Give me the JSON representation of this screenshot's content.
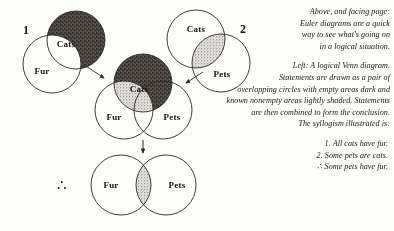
{
  "figure": {
    "colors": {
      "ink": "#2b2723",
      "dark_fill": "#4a4540",
      "stipple_fill": "#c9c6c0",
      "paper": "#fdfdfc"
    },
    "steps": [
      {
        "number": "1",
        "labels": [
          "Cats",
          "Fur"
        ]
      },
      {
        "number": "2",
        "labels": [
          "Cats",
          "Pets"
        ]
      }
    ],
    "combined": {
      "labels": [
        "Cats",
        "Fur",
        "Pets"
      ]
    },
    "conclusion": {
      "labels": [
        "Fur",
        "Pets"
      ],
      "therefore_symbol": "∴"
    },
    "step1_number": "1",
    "step2_number": "2",
    "label_cats": "Cats",
    "label_fur": "Fur",
    "label_pets": "Pets",
    "therefore_symbol": "∴"
  },
  "caption": {
    "block1": [
      "Above, and facing page:",
      "Euler diagrams are a quick",
      "way to see what's going on",
      "in a logical situation."
    ],
    "block2": [
      "Left:  A logical Venn diagram.",
      "Statements are drawn as a pair of",
      "overlapping circles with empty areas dark and",
      "known nonempty areas lightly shaded.  Statements",
      "are then combined to form the conclusion.",
      "The syllogism illustrated is:"
    ],
    "syllogism": [
      "1. All cats have fur.",
      "2. Some pets are cats.",
      "∴  Some pets have fur."
    ]
  }
}
